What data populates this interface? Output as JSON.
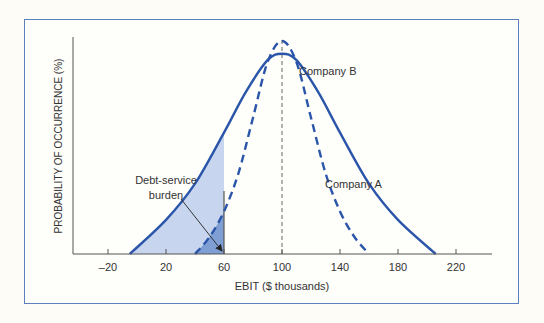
{
  "chart_data": {
    "type": "line",
    "title": "",
    "xlabel": "EBIT ($ thousands)",
    "ylabel": "PROBABILITY OF OCCURRENCE (%)",
    "x_ticks": [
      -20,
      20,
      60,
      100,
      140,
      180,
      220
    ],
    "xlim": [
      -44,
      234
    ],
    "grid": false,
    "legend": "inline labels",
    "series": [
      {
        "name": "Company A",
        "style": "solid",
        "x": [
          -5,
          20,
          40,
          60,
          75,
          90,
          100,
          110,
          125,
          140,
          160,
          180,
          206
        ],
        "y": [
          0,
          0.16,
          0.33,
          0.57,
          0.76,
          0.91,
          0.94,
          0.91,
          0.76,
          0.57,
          0.33,
          0.16,
          0
        ],
        "label_pos": {
          "x": 345,
          "y": 188
        }
      },
      {
        "name": "Company B",
        "style": "dashed",
        "x": [
          40,
          50,
          60,
          70,
          80,
          90,
          100,
          110,
          120,
          130,
          140,
          150,
          160
        ],
        "y": [
          0,
          0.08,
          0.2,
          0.38,
          0.64,
          0.9,
          1.0,
          0.9,
          0.64,
          0.38,
          0.2,
          0.08,
          0
        ],
        "label_pos": {
          "x": 299,
          "y": 75
        }
      }
    ],
    "annotations": [
      {
        "text": "Debt-service",
        "x": 166,
        "y": 184
      },
      {
        "text": "burden",
        "x": 166,
        "y": 199
      }
    ],
    "reference_lines": [
      {
        "x": 100,
        "style": "dashed",
        "label": "mean EBIT"
      },
      {
        "x": 60,
        "style": "solid",
        "label": "debt-service threshold"
      }
    ],
    "shaded_region": {
      "from": -5,
      "to": 60,
      "description": "Probability EBIT below debt-service burden"
    }
  },
  "colors": {
    "curve": "#2a55a8",
    "shade_light": "#c7d6ee",
    "shade_dark": "#7f9ed3",
    "frame": "#5b7fbf",
    "axis": "#555555"
  },
  "labels": {
    "company_a": "Company A",
    "company_b": "Company B",
    "debt_line1": "Debt-service",
    "debt_line2": "burden",
    "xlabel": "EBIT ($ thousands)",
    "ylabel": "PROBABILITY OF OCCURRENCE (%)",
    "ticks": [
      "-20",
      "20",
      "60",
      "100",
      "140",
      "180",
      "220"
    ]
  }
}
